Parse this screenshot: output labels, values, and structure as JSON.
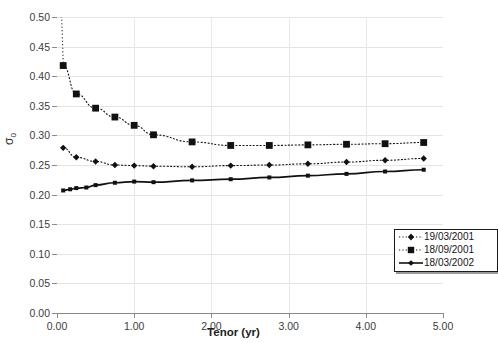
{
  "chart_data": {
    "type": "line",
    "title": "",
    "xlabel": "Tenor (yr)",
    "ylabel": "σ₀",
    "ylabel_base": "σ",
    "ylabel_sub": "0",
    "xlim": [
      0.0,
      5.0
    ],
    "ylim": [
      0.0,
      0.5
    ],
    "grid": true,
    "legend_position": "lower-right",
    "xticks": [
      "0.00",
      "1.00",
      "2.00",
      "3.00",
      "4.00",
      "5.00"
    ],
    "xtick_values": [
      0.0,
      1.0,
      2.0,
      3.0,
      4.0,
      5.0
    ],
    "yticks": [
      "0.00",
      "0.05",
      "0.10",
      "0.15",
      "0.20",
      "0.25",
      "0.30",
      "0.35",
      "0.40",
      "0.45",
      "0.50"
    ],
    "ytick_values": [
      0.0,
      0.05,
      0.1,
      0.15,
      0.2,
      0.25,
      0.3,
      0.35,
      0.4,
      0.45,
      0.5
    ],
    "series": [
      {
        "name": "19/03/2001",
        "style": "dotted",
        "marker": "diamond",
        "color": "#111111",
        "x": [
          0.08,
          0.25,
          0.5,
          0.75,
          1.0,
          1.25,
          1.75,
          2.25,
          2.75,
          3.25,
          3.75,
          4.25,
          4.75
        ],
        "y": [
          0.279,
          0.263,
          0.256,
          0.25,
          0.249,
          0.248,
          0.247,
          0.249,
          0.25,
          0.252,
          0.255,
          0.258,
          0.261
        ]
      },
      {
        "name": "18/09/2001",
        "style": "dotted",
        "marker": "square",
        "color": "#111111",
        "x": [
          0.08,
          0.25,
          0.5,
          0.75,
          1.0,
          1.25,
          1.75,
          2.25,
          2.75,
          3.25,
          3.75,
          4.25,
          4.75
        ],
        "y": [
          0.418,
          0.37,
          0.346,
          0.331,
          0.317,
          0.301,
          0.289,
          0.283,
          0.283,
          0.284,
          0.285,
          0.286,
          0.288
        ]
      },
      {
        "name": "18/03/2002",
        "style": "solid",
        "marker": "small-square",
        "color": "#111111",
        "x": [
          0.08,
          0.17,
          0.25,
          0.38,
          0.5,
          0.75,
          1.0,
          1.25,
          1.75,
          2.25,
          2.75,
          3.25,
          3.75,
          4.25,
          4.75
        ],
        "y": [
          0.207,
          0.209,
          0.211,
          0.212,
          0.216,
          0.22,
          0.222,
          0.221,
          0.224,
          0.226,
          0.229,
          0.232,
          0.235,
          0.239,
          0.242
        ]
      }
    ]
  },
  "legend": {
    "entries": [
      {
        "label": "19/03/2001",
        "marker": "diamond",
        "style": "dotted"
      },
      {
        "label": "18/09/2001",
        "marker": "square",
        "style": "dotted"
      },
      {
        "label": "18/03/2002",
        "marker": "small-square",
        "style": "solid"
      }
    ]
  }
}
